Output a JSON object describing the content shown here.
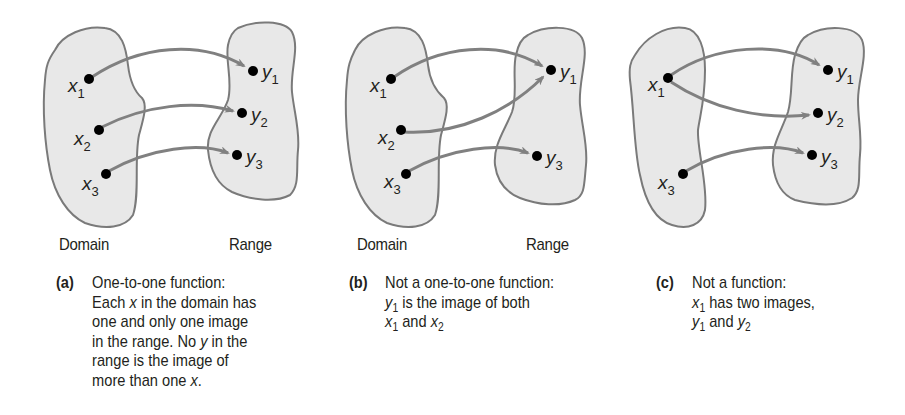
{
  "panels": [
    {
      "id": "a",
      "tag": "(a)",
      "domain_label": "Domain",
      "range_label": "Range",
      "domain_points": [
        {
          "name": "x",
          "sub": "1"
        },
        {
          "name": "x",
          "sub": "2"
        },
        {
          "name": "x",
          "sub": "3"
        }
      ],
      "range_points": [
        {
          "name": "y",
          "sub": "1"
        },
        {
          "name": "y",
          "sub": "2"
        },
        {
          "name": "y",
          "sub": "3"
        }
      ],
      "mappings": [
        [
          "x1",
          "y1"
        ],
        [
          "x2",
          "y2"
        ],
        [
          "x3",
          "y3"
        ]
      ],
      "caption": {
        "line1": "One-to-one function:",
        "line2_pre": "Each ",
        "line2_var": "x",
        "line2_post": " in the domain has",
        "line3": "one and only one image",
        "line4_pre": "in the range. No ",
        "line4_var": "y",
        "line4_post": " in the",
        "line5": "range is the image of",
        "line6_pre": "more than one ",
        "line6_var": "x",
        "line6_post": "."
      }
    },
    {
      "id": "b",
      "tag": "(b)",
      "domain_label": "Domain",
      "range_label": "Range",
      "domain_points": [
        {
          "name": "x",
          "sub": "1"
        },
        {
          "name": "x",
          "sub": "2"
        },
        {
          "name": "x",
          "sub": "3"
        }
      ],
      "range_points": [
        {
          "name": "y",
          "sub": "1"
        },
        {
          "name": "y",
          "sub": "3"
        }
      ],
      "mappings": [
        [
          "x1",
          "y1"
        ],
        [
          "x2",
          "y1"
        ],
        [
          "x3",
          "y3"
        ]
      ],
      "caption": {
        "line1": "Not a one-to-one function:",
        "line2_var": "y",
        "line2_sub": "1",
        "line2_post": " is the image of both",
        "line3_var1": "x",
        "line3_sub1": "1",
        "line3_mid": " and ",
        "line3_var2": "x",
        "line3_sub2": "2"
      }
    },
    {
      "id": "c",
      "tag": "(c)",
      "domain_points": [
        {
          "name": "x",
          "sub": "1"
        },
        {
          "name": "x",
          "sub": "3"
        }
      ],
      "range_points": [
        {
          "name": "y",
          "sub": "1"
        },
        {
          "name": "y",
          "sub": "2"
        },
        {
          "name": "y",
          "sub": "3"
        }
      ],
      "mappings": [
        [
          "x1",
          "y1"
        ],
        [
          "x1",
          "y2"
        ],
        [
          "x3",
          "y3"
        ]
      ],
      "caption": {
        "line1": "Not a function:",
        "line2_var": "x",
        "line2_sub": "1",
        "line2_post": " has two images,",
        "line3_var1": "y",
        "line3_sub1": "1",
        "line3_mid": " and ",
        "line3_var2": "y",
        "line3_sub2": "2"
      }
    }
  ],
  "colors": {
    "blob_fill": "#e8e8e8",
    "blob_stroke": "#7a7a7a",
    "arrow": "#808080",
    "point": "#000000",
    "text": "#231f20"
  }
}
